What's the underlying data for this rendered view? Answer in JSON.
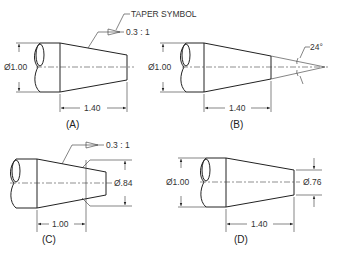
{
  "figure": {
    "callout": "TAPER SYMBOL",
    "panels": [
      {
        "id": "A",
        "label": "(A)",
        "diameter": "Ø1.00",
        "length": "1.40",
        "taper": "0.3 : 1"
      },
      {
        "id": "B",
        "label": "(B)",
        "diameter": "Ø1.00",
        "length": "1.40",
        "angle": "24°"
      },
      {
        "id": "C",
        "label": "(C)",
        "diameter": "Ø.84",
        "length": "1.00",
        "taper": "0.3 : 1"
      },
      {
        "id": "D",
        "label": "(D)",
        "diameter_large": "Ø1.00",
        "diameter_small": "Ø.76",
        "length": "1.40"
      }
    ]
  }
}
